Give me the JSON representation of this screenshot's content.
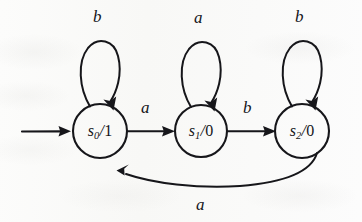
{
  "diagram": {
    "kind": "finite-state-machine-diagram",
    "ink_color": "#16161a",
    "background_color": "#fbfbfa",
    "states": [
      {
        "id": "s0",
        "name": "s",
        "index": "0",
        "separator": "/",
        "output": "1",
        "label": "s0/1",
        "is_start": true,
        "cx": 100,
        "cy": 131,
        "r": 27
      },
      {
        "id": "s1",
        "name": "s",
        "index": "1",
        "separator": "/",
        "output": "0",
        "label": "s1/0",
        "is_start": false,
        "cx": 201,
        "cy": 131,
        "r": 26
      },
      {
        "id": "s2",
        "name": "s",
        "index": "2",
        "separator": "/",
        "output": "0",
        "label": "s2/0",
        "is_start": false,
        "cx": 302,
        "cy": 131,
        "r": 27
      }
    ],
    "start_arrow": {
      "label": "",
      "from_x": 22,
      "to_x": 70,
      "y": 131
    },
    "transitions": [
      {
        "id": "t-s0-s0",
        "from": "s0",
        "to": "s0",
        "input": "b",
        "kind": "self-loop",
        "label_x": 93,
        "label_y": 8
      },
      {
        "id": "t-s1-s1",
        "from": "s1",
        "to": "s1",
        "input": "a",
        "kind": "self-loop",
        "label_x": 194,
        "label_y": 9
      },
      {
        "id": "t-s2-s2",
        "from": "s2",
        "to": "s2",
        "input": "b",
        "kind": "self-loop",
        "label_x": 295,
        "label_y": 8
      },
      {
        "id": "t-s0-s1",
        "from": "s0",
        "to": "s1",
        "input": "a",
        "kind": "straight",
        "label_x": 141,
        "label_y": 99
      },
      {
        "id": "t-s1-s2",
        "from": "s1",
        "to": "s2",
        "input": "b",
        "kind": "straight",
        "label_x": 243,
        "label_y": 99
      },
      {
        "id": "t-s2-s0",
        "from": "s2",
        "to": "s0",
        "input": "a",
        "kind": "return-curve",
        "label_x": 196,
        "label_y": 196
      }
    ]
  }
}
